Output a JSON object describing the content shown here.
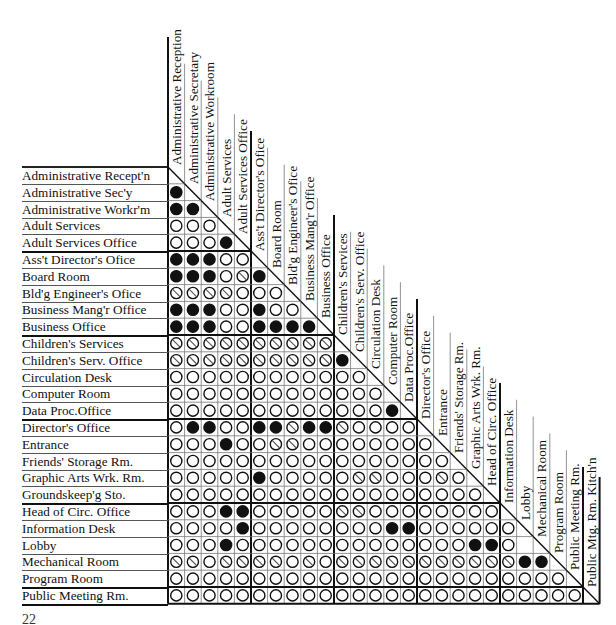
{
  "diagram": {
    "type": "adjacency-matrix",
    "legend_symbols": {
      "F": "filled-circle (strong/required adjacency)",
      "O": "open-circle (no requirement)",
      "S": "slashed-circle (undesirable/avoid)"
    },
    "rooms": [
      "Administrative Recept'n",
      "Administrative Sec'y",
      "Administrative Workr'm",
      "Adult Services",
      "Adult Services Office",
      "Ass't Director's Ofice",
      "Board Room",
      "Bld'g Engineer's Ofice",
      "Business Mang'r Office",
      "Business Office",
      "Children's Services",
      "Children's Serv. Office",
      "Circulation Desk",
      "Computer Room",
      "Data Proc.Office",
      "Director's Office",
      "Entrance",
      "Friends' Storage Rm.",
      "Graphic Arts Wrk. Rm.",
      "Groundskeep'g Sto.",
      "Head of Circ. Office",
      "Information Desk",
      "Lobby",
      "Mechanical Room",
      "Program Room",
      "Public Meeting Rm."
    ],
    "columns": [
      "Administrative Reception",
      "Administrative Secretary",
      "Administrative Workroom",
      "Adult Services",
      "Adult Services Office",
      "Ass't Director's Ofice",
      "Board Room",
      "Bld'g Engineer's Ofice",
      "Business Mang'r Office",
      "Business Office",
      "Children's Services",
      "Children's Serv. Office",
      "Circulation Desk",
      "Computer Room",
      "Data Proc.Office",
      "Director's Office",
      "Entrance",
      "Friends' Storage Rm.",
      "Graphic Arts Wrk. Rm.",
      "Head of Circ. Office",
      "Information Desk",
      "Lobby",
      "Mechanical Room",
      "Program Room",
      "Public Meeting Rm.",
      "Public Mtg. Rm. Kitch'n"
    ],
    "matrix": [
      "",
      "F",
      "FF",
      "OOO",
      "OOOF",
      "FFFOO",
      "FFFOSF",
      "SSSSOOO",
      "FFFOOFOO",
      "FFFOOFFFF",
      "SSSSSSSSSS",
      "SSSSSSSSSSF",
      "OOOOOOOOOOOO",
      "OOOOOOOOOOOOO",
      "OOOOOOOOOOOOOF",
      "OFFOOFFSFFSOOOO",
      "OOOFOOSSOOOOOOOO",
      "OOOOOOOOOOOOOOOOO",
      "OOOOOFOOOOOSSOOOSO",
      "OOOOOOOOOOOOOOOOOOO",
      "OOOFFOOOOOSSOOOOOOOO",
      "OOOOFOOOOOOOOFFOOOOOO",
      "OOOFOOOOOOOOOOOOOOFFO",
      "SSOSSSSOSOSSSSSSSSSSSFF",
      "OOOOOOOOOOOOOOOOOOOOOOOO",
      "OOOOOOOOOOOOOOOOOOOOOOOOO"
    ]
  },
  "footer": {
    "page_marker": "22"
  }
}
